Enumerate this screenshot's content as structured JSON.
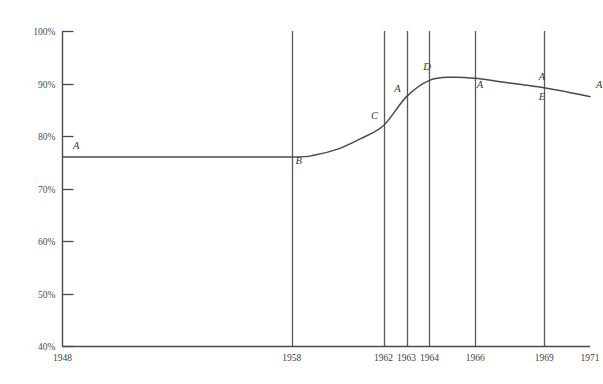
{
  "chart_data": {
    "type": "line",
    "title": "",
    "subtitle": "",
    "xlabel": "",
    "ylabel": "",
    "xlim": [
      1948,
      1971
    ],
    "ylim": [
      40,
      100
    ],
    "grid": "vertical-only",
    "legend": "none",
    "y_ticks": [
      "40%",
      "50%",
      "60%",
      "70%",
      "80%",
      "90%",
      "100%"
    ],
    "y_tick_values": [
      40,
      50,
      60,
      70,
      80,
      90,
      100
    ],
    "x_ticks": [
      "1948",
      "1958",
      "1962",
      "1963",
      "1964",
      "1966",
      "1969",
      "1971"
    ],
    "x_tick_values": [
      1948,
      1958,
      1962,
      1963,
      1964,
      1966,
      1969,
      1971
    ],
    "gridline_years": [
      1958,
      1962,
      1963,
      1964,
      1966,
      1969
    ],
    "series": [
      {
        "name": "percentage",
        "x": [
          1948,
          1953,
          1958,
          1959,
          1960,
          1961,
          1962,
          1963,
          1964,
          1965,
          1966,
          1967,
          1968,
          1969,
          1970,
          1971
        ],
        "values": [
          76.0,
          76.0,
          76.0,
          76.4,
          77.5,
          79.5,
          82.0,
          87.5,
          90.6,
          91.2,
          91.0,
          90.4,
          89.8,
          89.2,
          88.4,
          87.5
        ]
      }
    ],
    "annotations": [
      {
        "label": "A",
        "x": 1948.6,
        "y": 77.6
      },
      {
        "label": "B",
        "x": 1958.3,
        "y": 74.6
      },
      {
        "label": "C",
        "x": 1961.6,
        "y": 83.2
      },
      {
        "label": "A",
        "x": 1962.6,
        "y": 88.4
      },
      {
        "label": "D",
        "x": 1963.9,
        "y": 92.6
      },
      {
        "label": "A",
        "x": 1966.2,
        "y": 89.1
      },
      {
        "label": "A",
        "x": 1968.9,
        "y": 90.6
      },
      {
        "label": "E",
        "x": 1968.9,
        "y": 86.8
      },
      {
        "label": "A",
        "x": 1971.4,
        "y": 89.2
      }
    ]
  },
  "colors": {
    "background": "#ffffff",
    "axis": "#4a4a4a",
    "gridline": "#5a5a5a",
    "curve": "#4a4a4a",
    "tick_text": "#4c4c4c",
    "annotation_text": "#3a3a3a"
  }
}
